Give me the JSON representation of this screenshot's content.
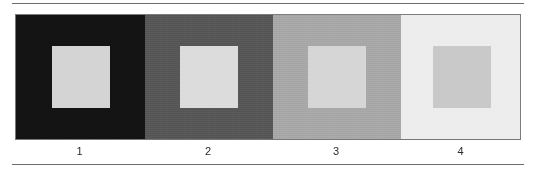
{
  "figure": {
    "kind": "lightness-contrast-demonstration",
    "background_color": "#ffffff",
    "rule_color": "#6d6d6d",
    "border_color": "#7a7a7a",
    "panels": [
      {
        "label": "1",
        "background_color": "#131313",
        "inner_square_color": "#d4d4d4",
        "width_px": 129
      },
      {
        "label": "2",
        "background_color": "#575757",
        "inner_square_color": "#dcdcdc",
        "width_px": 128
      },
      {
        "label": "3",
        "background_color": "#a8a8a8",
        "inner_square_color": "#d6d6d6",
        "width_px": 128
      },
      {
        "label": "4",
        "background_color": "#ededed",
        "inner_square_color": "#c9c9c9",
        "width_px": 121
      }
    ]
  },
  "chart_data": {
    "type": "heatmap",
    "title": "",
    "xlabel": "",
    "ylabel": "",
    "categories": [
      "1",
      "2",
      "3",
      "4"
    ],
    "series": [
      {
        "name": "surround luminance",
        "values": [
          19,
          87,
          168,
          237
        ]
      },
      {
        "name": "inner patch luminance",
        "values": [
          212,
          220,
          214,
          201
        ]
      }
    ],
    "legend_position": "none",
    "grid": false,
    "annotations": [
      "Four panels, surround lightness increasing left to right",
      "Each panel contains one identical light-gray square patch"
    ]
  }
}
